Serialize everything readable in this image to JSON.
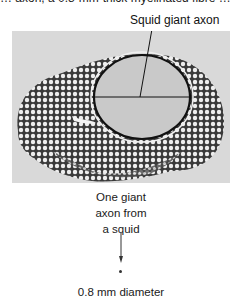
{
  "figure": {
    "clipped_top_text": "… axon, a 0.8-mm-thick myelinated fibre …",
    "label": "Squid giant axon",
    "micrograph": {
      "description": "cross-section micrograph of nerve bundle with one giant axon",
      "background_color": "#d6d6d6",
      "axon_fill_color": "#c8c8c8",
      "fibre_color": "#f2f2f2"
    },
    "caption_lines": [
      "One giant",
      "axon from",
      "a squid"
    ],
    "diameter_label": "0.8 mm diameter",
    "icons": {
      "arrow": "down-arrow-icon",
      "dot": "scale-dot-icon"
    }
  }
}
